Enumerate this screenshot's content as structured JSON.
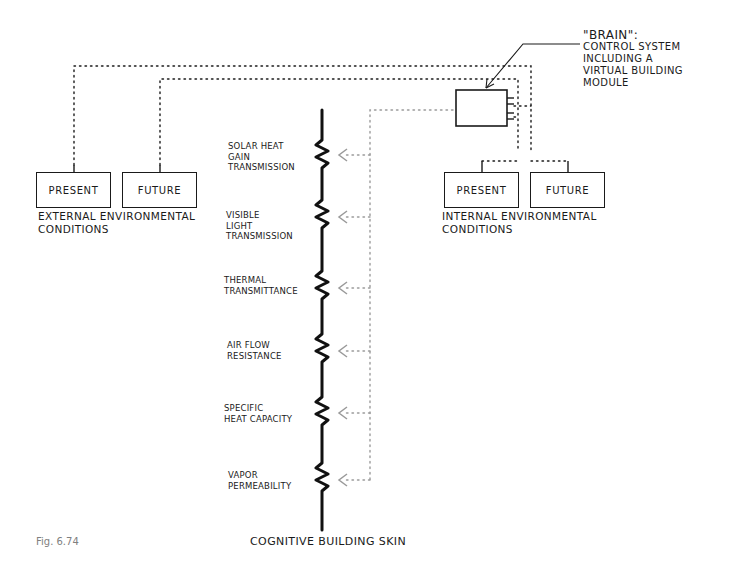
{
  "diagram": {
    "figure_label": "Fig. 6.74",
    "brain": {
      "title": "\"BRAIN\":",
      "lines": [
        "CONTROL SYSTEM",
        "INCLUDING A",
        "VIRTUAL BUILDING",
        "MODULE"
      ]
    },
    "external": {
      "present_label": "PRESENT",
      "future_label": "FUTURE",
      "caption_line1": "EXTERNAL ENVIRONMENTAL",
      "caption_line2": "CONDITIONS"
    },
    "internal": {
      "present_label": "PRESENT",
      "future_label": "FUTURE",
      "caption_line1": "INTERNAL ENVIRONMENTAL",
      "caption_line2": "CONDITIONS"
    },
    "skin": {
      "label": "COGNITIVE BUILDING SKIN",
      "parameters": [
        {
          "lines": [
            "SOLAR HEAT",
            "GAIN",
            "TRANSMISSION"
          ]
        },
        {
          "lines": [
            "VISIBLE",
            "LIGHT",
            "TRANSMISSION"
          ]
        },
        {
          "lines": [
            "THERMAL",
            "TRANSMITTANCE"
          ]
        },
        {
          "lines": [
            "AIR FLOW",
            "RESISTANCE"
          ]
        },
        {
          "lines": [
            "SPECIFIC",
            "HEAT CAPACITY"
          ]
        },
        {
          "lines": [
            "VAPOR",
            "PERMEABILITY"
          ]
        }
      ]
    },
    "colors": {
      "ink": "#1a1a1a",
      "dotted_control": "#9a9a9a",
      "caption_gray": "#808080"
    }
  }
}
